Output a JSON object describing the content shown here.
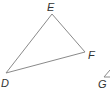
{
  "diagram": {
    "type": "geometry-triangle",
    "stroke_color": "#8a8a8a",
    "label_color": "#333333",
    "triangle_DEF": {
      "vertices": [
        {
          "name": "E",
          "label": "E",
          "x": 52,
          "y": 14,
          "label_x": 47,
          "label_y": 11
        },
        {
          "name": "F",
          "label": "F",
          "x": 85,
          "y": 52,
          "label_x": 88,
          "label_y": 59
        },
        {
          "name": "D",
          "label": "D",
          "x": 6,
          "y": 73,
          "label_x": 1,
          "label_y": 87
        }
      ]
    },
    "partial_figure": {
      "vertices": [
        {
          "name": "G",
          "label": "G",
          "x": 104,
          "y": 77,
          "label_x": 98,
          "label_y": 88
        }
      ]
    }
  }
}
